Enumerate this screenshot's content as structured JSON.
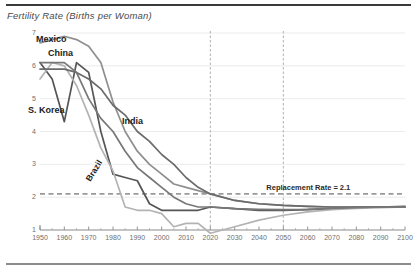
{
  "chart_data": {
    "type": "line",
    "title": "Fertility Rate (Births per Woman)",
    "xlabel": "",
    "ylabel": "",
    "xlim": [
      1950,
      2100
    ],
    "ylim": [
      1,
      7
    ],
    "grid": true,
    "legend_position": "inline-annotations",
    "yticks": [
      "7",
      "6",
      "5",
      "4",
      "3",
      "2",
      "1"
    ],
    "ytick_values": [
      7,
      6,
      5,
      4,
      3,
      2,
      1
    ],
    "xticks": [
      "1950",
      "1960",
      "1970",
      "1980",
      "1990",
      "2000",
      "2010",
      "2020",
      "2030",
      "2040",
      "2050",
      "2060",
      "2070",
      "2080",
      "2090",
      "2100"
    ],
    "xtick_values": [
      1950,
      1960,
      1970,
      1980,
      1990,
      2000,
      2010,
      2020,
      2030,
      2040,
      2050,
      2060,
      2070,
      2080,
      2090,
      2100
    ],
    "x": [
      1950,
      1955,
      1960,
      1965,
      1970,
      1975,
      1980,
      1985,
      1990,
      1995,
      2000,
      2005,
      2010,
      2015,
      2020,
      2030,
      2040,
      2050,
      2060,
      2070,
      2080,
      2090,
      2100
    ],
    "series": [
      {
        "name": "Mexico",
        "color": "#8f8f8f",
        "values": [
          6.7,
          6.8,
          6.9,
          6.8,
          6.6,
          6.1,
          4.9,
          4.0,
          3.4,
          3.0,
          2.7,
          2.4,
          2.3,
          2.2,
          2.1,
          1.9,
          1.8,
          1.75,
          1.72,
          1.7,
          1.7,
          1.7,
          1.7
        ]
      },
      {
        "name": "China",
        "color": "#555555",
        "values": [
          6.1,
          5.6,
          4.3,
          6.1,
          5.8,
          4.0,
          2.7,
          2.6,
          2.5,
          1.8,
          1.6,
          1.6,
          1.6,
          1.6,
          1.7,
          1.65,
          1.6,
          1.6,
          1.62,
          1.65,
          1.68,
          1.7,
          1.72
        ]
      },
      {
        "name": "S. Korea",
        "color": "#b3b3b3",
        "values": [
          5.6,
          6.1,
          6.0,
          5.4,
          4.5,
          3.5,
          2.8,
          1.7,
          1.6,
          1.6,
          1.5,
          1.1,
          1.2,
          1.2,
          0.9,
          1.1,
          1.3,
          1.45,
          1.55,
          1.62,
          1.66,
          1.68,
          1.7
        ]
      },
      {
        "name": "India",
        "color": "#6b6b6b",
        "values": [
          5.9,
          5.9,
          5.9,
          5.8,
          5.6,
          5.3,
          4.8,
          4.5,
          4.0,
          3.7,
          3.3,
          3.0,
          2.6,
          2.3,
          2.1,
          1.9,
          1.8,
          1.75,
          1.72,
          1.7,
          1.7,
          1.7,
          1.7
        ]
      },
      {
        "name": "Brazil",
        "color": "#777777",
        "values": [
          6.1,
          6.1,
          6.1,
          5.8,
          5.0,
          4.4,
          4.0,
          3.4,
          2.9,
          2.6,
          2.3,
          2.0,
          1.8,
          1.7,
          1.7,
          1.65,
          1.63,
          1.62,
          1.63,
          1.66,
          1.68,
          1.7,
          1.7
        ]
      }
    ],
    "annotations": [
      {
        "name": "replacement-rate",
        "label": "Replacement Rate = 2.1",
        "value": 2.1,
        "style": "dashed-horizontal",
        "color": "#9a9a9a"
      },
      {
        "name": "marker-2020",
        "label": "2020",
        "value": 2020,
        "style": "dashed-vertical",
        "color": "#a8a8a8"
      },
      {
        "name": "marker-2050",
        "label": "2050",
        "value": 2050,
        "style": "dashed-vertical",
        "color": "#a8a8a8"
      }
    ]
  }
}
